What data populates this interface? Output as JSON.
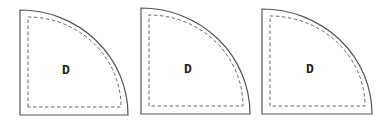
{
  "diagram": {
    "shapes": [
      {
        "label": "D",
        "outer": {
          "x": 20,
          "y": 10,
          "w": 108,
          "h": 105
        },
        "inner": {
          "x": 28,
          "y": 17,
          "w": 93,
          "h": 90
        },
        "label_pos": {
          "x": 66,
          "y": 74
        }
      },
      {
        "label": "D",
        "outer": {
          "x": 141,
          "y": 8,
          "w": 109,
          "h": 106
        },
        "inner": {
          "x": 149,
          "y": 15,
          "w": 94,
          "h": 91
        },
        "label_pos": {
          "x": 188,
          "y": 73
        }
      },
      {
        "label": "D",
        "outer": {
          "x": 262,
          "y": 9,
          "w": 110,
          "h": 105
        },
        "inner": {
          "x": 270,
          "y": 16,
          "w": 95,
          "h": 90
        },
        "label_pos": {
          "x": 310,
          "y": 73
        }
      }
    ],
    "colors": {
      "stroke": "#555555",
      "dash": "#666666",
      "text": "#222222"
    }
  }
}
